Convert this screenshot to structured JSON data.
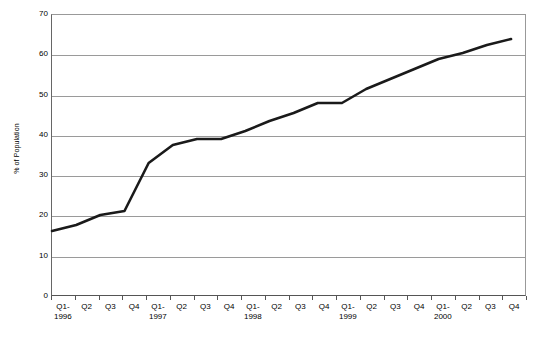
{
  "chart_data": {
    "type": "line",
    "title": "",
    "subtitle": "",
    "xlabel": "",
    "ylabel": "% of Population",
    "ylim": [
      0,
      70
    ],
    "ytick_step": 10,
    "yticks": [
      0,
      10,
      20,
      30,
      40,
      50,
      60,
      70
    ],
    "ytick_labels": [
      "0",
      "10",
      "20",
      "30",
      "40",
      "50",
      "60",
      "70"
    ],
    "grid": true,
    "grid_axis": "y",
    "legend": false,
    "legend_position": "none",
    "line_color": "#1a1a1a",
    "grid_color": "#9a9a9a",
    "axis_color": "#555555",
    "background": "#ffffff",
    "categories": [
      "Q1-1996",
      "Q2",
      "Q3",
      "Q4",
      "Q1-1997",
      "Q2",
      "Q3",
      "Q4",
      "Q1-1998",
      "Q2",
      "Q3",
      "Q4",
      "Q1-1999",
      "Q2",
      "Q3",
      "Q4",
      "Q1-2000",
      "Q2",
      "Q3",
      "Q4"
    ],
    "tick_labels": [
      {
        "line1": "Q1-",
        "line2": "1996"
      },
      {
        "line1": "Q2",
        "line2": ""
      },
      {
        "line1": "Q3",
        "line2": ""
      },
      {
        "line1": "Q4",
        "line2": ""
      },
      {
        "line1": "Q1-",
        "line2": "1997"
      },
      {
        "line1": "Q2",
        "line2": ""
      },
      {
        "line1": "Q3",
        "line2": ""
      },
      {
        "line1": "Q4",
        "line2": ""
      },
      {
        "line1": "Q1-",
        "line2": "1998"
      },
      {
        "line1": "Q2",
        "line2": ""
      },
      {
        "line1": "Q3",
        "line2": ""
      },
      {
        "line1": "Q4",
        "line2": ""
      },
      {
        "line1": "Q1-",
        "line2": "1999"
      },
      {
        "line1": "Q2",
        "line2": ""
      },
      {
        "line1": "Q3",
        "line2": ""
      },
      {
        "line1": "Q4",
        "line2": ""
      },
      {
        "line1": "Q1-",
        "line2": "2000"
      },
      {
        "line1": "Q2",
        "line2": ""
      },
      {
        "line1": "Q3",
        "line2": ""
      },
      {
        "line1": "Q4",
        "line2": ""
      }
    ],
    "values": [
      16,
      17.5,
      20,
      21,
      33,
      37.5,
      39,
      39,
      41,
      43.5,
      45.5,
      48,
      48,
      51.5,
      54,
      56.5,
      59,
      60.5,
      62.5,
      64
    ],
    "series": [
      {
        "name": "% of Population",
        "values": [
          16,
          17.5,
          20,
          21,
          33,
          37.5,
          39,
          39,
          41,
          43.5,
          45.5,
          48,
          48,
          51.5,
          54,
          56.5,
          59,
          60.5,
          62.5,
          64
        ]
      }
    ]
  }
}
